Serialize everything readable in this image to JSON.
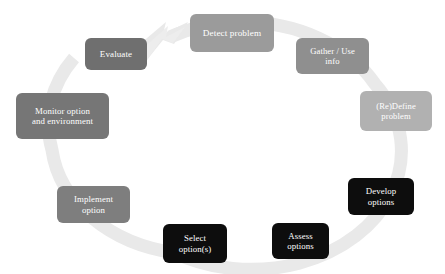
{
  "diagram": {
    "type": "cycle",
    "direction": "clockwise",
    "background_color": "#ffffff",
    "ring": {
      "name": "cycle-arrow-ring",
      "color": "#e9e9e9",
      "arrowhead_target": "Detect problem",
      "arrowhead_direction": "up-right"
    },
    "steps": [
      {
        "id": "detect-problem",
        "label": "Detect problem",
        "fill": "#9b9b9b",
        "text_color": "#ffffff",
        "left": 190,
        "top": 14,
        "width": 84,
        "height": 38,
        "font_size": 9.2
      },
      {
        "id": "gather-use-info",
        "label": "Gather / Use\ninfo",
        "fill": "#8f8f8f",
        "text_color": "#ffffff",
        "left": 296,
        "top": 38,
        "width": 73,
        "height": 36,
        "font_size": 8.6
      },
      {
        "id": "redefine-problem",
        "label": "(Re)Define\nproblem",
        "fill": "#b1b1b1",
        "text_color": "#ffffff",
        "left": 360,
        "top": 91,
        "width": 72,
        "height": 40,
        "font_size": 8.6
      },
      {
        "id": "develop-options",
        "label": "Develop\noptions",
        "fill": "#0d0d0d",
        "text_color": "#ffffff",
        "left": 348,
        "top": 178,
        "width": 66,
        "height": 37,
        "font_size": 8.8
      },
      {
        "id": "assess-options",
        "label": "Assess\noptions",
        "fill": "#0d0d0d",
        "text_color": "#ffffff",
        "left": 272,
        "top": 223,
        "width": 57,
        "height": 36,
        "font_size": 8.8
      },
      {
        "id": "select-options",
        "label": "Select\noption(s)",
        "fill": "#0d0d0d",
        "text_color": "#ffffff",
        "left": 163,
        "top": 224,
        "width": 64,
        "height": 39,
        "font_size": 8.8
      },
      {
        "id": "implement-option",
        "label": "Implement\noption",
        "fill": "#7e7e7e",
        "text_color": "#ffffff",
        "left": 57,
        "top": 186,
        "width": 73,
        "height": 37,
        "font_size": 8.8
      },
      {
        "id": "monitor-option-and-environment",
        "label": "Monitor option\nand environment",
        "fill": "#767676",
        "text_color": "#ffffff",
        "left": 16,
        "top": 93,
        "width": 93,
        "height": 46,
        "font_size": 8.8
      },
      {
        "id": "evaluate",
        "label": "Evaluate",
        "fill": "#6f6f6f",
        "text_color": "#ffffff",
        "left": 85,
        "top": 38,
        "width": 62,
        "height": 32,
        "font_size": 9.0
      }
    ]
  }
}
